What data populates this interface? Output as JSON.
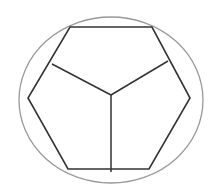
{
  "diagram": {
    "colors": {
      "background": "#ffffff",
      "hexagon_stroke": "#333333",
      "spoke_stroke": "#333333",
      "ellipse_stroke": "#999999"
    },
    "ellipse": {
      "cx": 111,
      "cy": 100,
      "rx": 92,
      "ry": 83
    },
    "hexagon_points": [
      [
        70,
        27
      ],
      [
        152,
        27
      ],
      [
        190,
        98
      ],
      [
        149,
        169
      ],
      [
        68,
        169
      ],
      [
        28,
        98
      ]
    ],
    "center": [
      111,
      95
    ],
    "spokes": [
      {
        "name": "left-spoke",
        "from": [
          111,
          95
        ],
        "to": [
          52,
          64
        ]
      },
      {
        "name": "right-spoke",
        "from": [
          111,
          95
        ],
        "to": [
          168,
          61
        ]
      },
      {
        "name": "bottom-spoke",
        "from": [
          111,
          95
        ],
        "to": [
          111,
          172
        ]
      }
    ]
  }
}
